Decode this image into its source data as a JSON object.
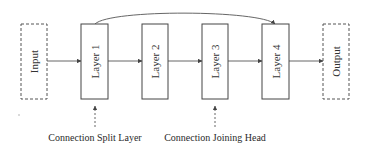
{
  "diagram": {
    "nodes": [
      {
        "id": "input",
        "label": "Input",
        "style": "dashed"
      },
      {
        "id": "layer1",
        "label": "Layer 1",
        "style": "solid"
      },
      {
        "id": "layer2",
        "label": "Layer 2",
        "style": "solid"
      },
      {
        "id": "layer3",
        "label": "Layer 3",
        "style": "solid"
      },
      {
        "id": "layer4",
        "label": "Layer 4",
        "style": "solid"
      },
      {
        "id": "output",
        "label": "Output",
        "style": "dashed"
      }
    ],
    "edges": [
      {
        "from": "input",
        "to": "layer1"
      },
      {
        "from": "layer1",
        "to": "layer2"
      },
      {
        "from": "layer2",
        "to": "layer3"
      },
      {
        "from": "layer3",
        "to": "layer4"
      },
      {
        "from": "layer4",
        "to": "output"
      },
      {
        "from": "layer1",
        "to": "layer4",
        "type": "skip-connection"
      }
    ],
    "annotations": [
      {
        "label": "Connection Split Layer",
        "points_to": "layer1"
      },
      {
        "label": "Connection Joining Head",
        "points_to": "layer3"
      }
    ],
    "colors": {
      "stroke": "#444444",
      "text": "#333333",
      "background": "#ffffff"
    }
  }
}
